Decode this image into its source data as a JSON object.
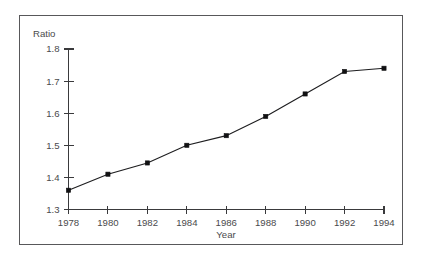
{
  "figure": {
    "clipped_header_ghost": ". . . . . .",
    "y_axis_title": "Ratio",
    "x_axis_title": "Year"
  },
  "chart_data": {
    "type": "line",
    "title": "",
    "subtitle": "",
    "xlabel": "Year",
    "ylabel": "Ratio",
    "x": [
      1978,
      1980,
      1982,
      1984,
      1986,
      1988,
      1990,
      1992,
      1994
    ],
    "values": [
      1.36,
      1.41,
      1.445,
      1.5,
      1.53,
      1.59,
      1.66,
      1.73,
      1.74
    ],
    "xtick_labels": [
      "1978",
      "1980",
      "1982",
      "1984",
      "1986",
      "1988",
      "1990",
      "1992",
      "1994"
    ],
    "ytick_labels": [
      "1.3",
      "1.4",
      "1.5",
      "1.6",
      "1.7",
      "1.8"
    ],
    "yticks": [
      1.3,
      1.4,
      1.5,
      1.6,
      1.7,
      1.8
    ],
    "xlim": [
      1978,
      1994
    ],
    "ylim": [
      1.3,
      1.8
    ],
    "grid": false,
    "legend": false,
    "legend_position": "none",
    "marker": "square",
    "line_color": "#1d1d1f",
    "marker_color": "#111113",
    "annotations": []
  }
}
